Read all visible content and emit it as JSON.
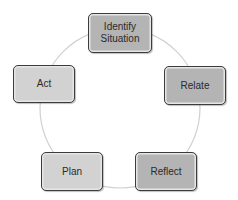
{
  "diagram": {
    "type": "cycle",
    "ring_color": "#d0d0d0",
    "border_color": "#3c3c3c",
    "nodes": [
      {
        "id": "identify-situation",
        "label": "Identify Situation",
        "line1": "Identify",
        "line2": "Situation",
        "shade": "dark",
        "fill": "#b4b4b4"
      },
      {
        "id": "relate",
        "label": "Relate",
        "shade": "dark",
        "fill": "#b4b4b4"
      },
      {
        "id": "reflect",
        "label": "Reflect",
        "shade": "dark",
        "fill": "#b4b4b4"
      },
      {
        "id": "plan",
        "label": "Plan",
        "shade": "light",
        "fill": "#d2d2d2"
      },
      {
        "id": "act",
        "label": "Act",
        "shade": "light",
        "fill": "#d2d2d2"
      }
    ]
  }
}
